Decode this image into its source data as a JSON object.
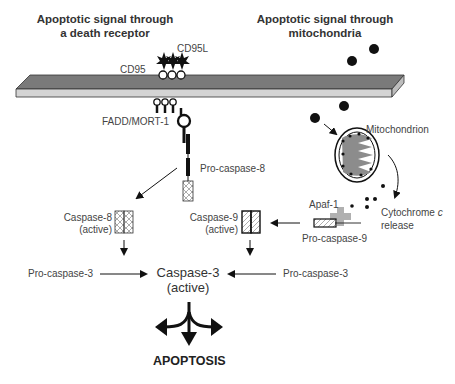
{
  "headers": {
    "left": [
      "Apoptotic signal through",
      "a death receptor"
    ],
    "right": [
      "Apoptotic signal through",
      "mitochondria"
    ]
  },
  "labels": {
    "cd95l": "CD95L",
    "cd95": "CD95",
    "fadd": "FADD/MORT-1",
    "procaspase8": "Pro-caspase-8",
    "mitochondrion": "Mitochondrion",
    "apaf1": "Apaf-1",
    "cytochrome": "Cytochrome",
    "cytochrome_c": "c",
    "release": "release",
    "procaspase9": "Pro-caspase-9",
    "caspase8": "Caspase-8",
    "caspase8_state": "(active)",
    "caspase9": "Caspase-9",
    "caspase9_state": "(active)",
    "procaspase3_left": "Pro-caspase-3",
    "procaspase3_right": "Pro-caspase-3",
    "caspase3": "Caspase-3",
    "caspase3_state": "(active)",
    "apoptosis": "APOPTOSIS"
  },
  "colors": {
    "membrane_top": "#7a7a7a",
    "membrane_side": "#d4d4d4",
    "mito_matrix": "#8c8c8c",
    "apaf_cross": "#b0b0b0",
    "ink": "#111111"
  },
  "icons": [
    "ligand-star-icon",
    "receptor-circle-icon",
    "signal-molecule-icon",
    "mitochondrion-icon",
    "caspase-box-icon",
    "arrow-icon",
    "three-way-arrow-icon"
  ]
}
